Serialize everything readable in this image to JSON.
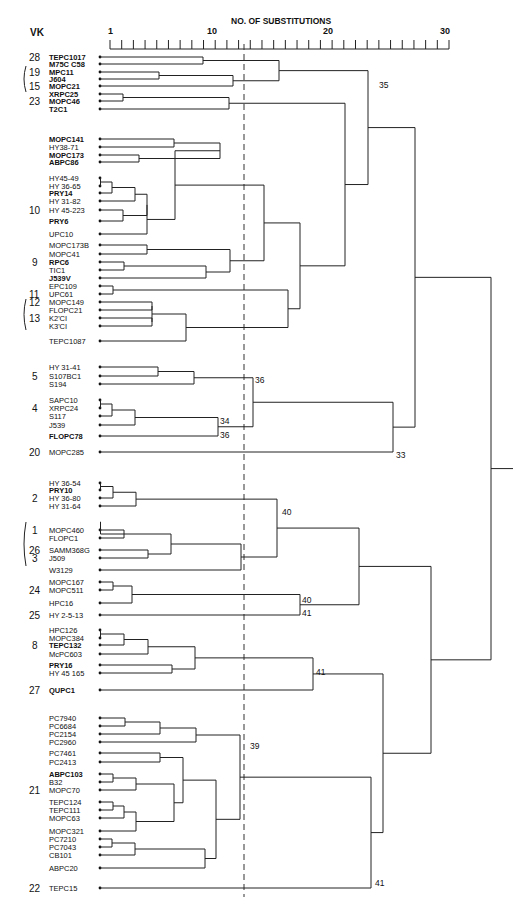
{
  "chart_data": {
    "type": "dendrogram",
    "title": "NO. OF SUBSTITUTIONS",
    "vk_header": "VK",
    "axis": {
      "ticks_labeled": [
        "1",
        "10",
        "20",
        "30"
      ],
      "range": [
        1,
        30
      ],
      "minor_ticks": 30
    },
    "threshold_line_value": 12,
    "leaves": [
      {
        "name": "TEPC1017",
        "bold": true,
        "vk": "28",
        "y": 57
      },
      {
        "name": "M75C C58",
        "bold": true,
        "vk": "",
        "y": 64
      },
      {
        "name": "MPC11",
        "bold": true,
        "vk": "19",
        "y": 72
      },
      {
        "name": "J604",
        "bold": true,
        "vk": "",
        "y": 79
      },
      {
        "name": "MOPC21",
        "bold": true,
        "vk": "15",
        "y": 86
      },
      {
        "name": "XRPC25",
        "bold": true,
        "vk": "",
        "y": 94
      },
      {
        "name": "MOPC46",
        "bold": true,
        "vk": "23",
        "y": 101
      },
      {
        "name": "T2C1",
        "bold": true,
        "vk": "",
        "y": 109
      },
      {
        "name": "MOPC141",
        "bold": true,
        "vk": "",
        "y": 139
      },
      {
        "name": "HY38-71",
        "bold": false,
        "vk": "",
        "y": 147
      },
      {
        "name": "MOPC173",
        "bold": true,
        "vk": "",
        "y": 155
      },
      {
        "name": "ABPC86",
        "bold": true,
        "vk": "",
        "y": 162
      },
      {
        "name": "HY45-49",
        "bold": false,
        "vk": "",
        "y": 178
      },
      {
        "name": "HY 36-65",
        "bold": false,
        "vk": "",
        "y": 186
      },
      {
        "name": "PRY14",
        "bold": true,
        "vk": "",
        "y": 193
      },
      {
        "name": "HY 31-82",
        "bold": false,
        "vk": "",
        "y": 201
      },
      {
        "name": "HY 45-223",
        "bold": false,
        "vk": "10",
        "y": 210
      },
      {
        "name": "PRY6",
        "bold": true,
        "vk": "",
        "y": 221
      },
      {
        "name": "UPC10",
        "bold": false,
        "vk": "",
        "y": 234
      },
      {
        "name": "MOPC173B",
        "bold": false,
        "vk": "",
        "y": 245
      },
      {
        "name": "MOPC41",
        "bold": false,
        "vk": "",
        "y": 254
      },
      {
        "name": "RPC6",
        "bold": true,
        "vk": "9",
        "y": 262
      },
      {
        "name": "TIC1",
        "bold": false,
        "vk": "",
        "y": 270
      },
      {
        "name": "J539V",
        "bold": true,
        "vk": "",
        "y": 278
      },
      {
        "name": "EPC109",
        "bold": false,
        "vk": "",
        "y": 286
      },
      {
        "name": "UPC61",
        "bold": false,
        "vk": "11",
        "y": 294
      },
      {
        "name": "MOPC149",
        "bold": false,
        "vk": "12",
        "y": 302
      },
      {
        "name": "FLOPC21",
        "bold": false,
        "vk": "",
        "y": 310
      },
      {
        "name": "K2'CI",
        "bold": false,
        "vk": "13",
        "y": 318
      },
      {
        "name": "K3'CI",
        "bold": false,
        "vk": "",
        "y": 326
      },
      {
        "name": "TEPC1087",
        "bold": false,
        "vk": "",
        "y": 341
      },
      {
        "name": "HY 31-41",
        "bold": false,
        "vk": "",
        "y": 367
      },
      {
        "name": "S107BC1",
        "bold": false,
        "vk": "5",
        "y": 376
      },
      {
        "name": "S194",
        "bold": false,
        "vk": "",
        "y": 384
      },
      {
        "name": "SAPC10",
        "bold": false,
        "vk": "",
        "y": 400
      },
      {
        "name": "XRPC24",
        "bold": false,
        "vk": "4",
        "y": 408
      },
      {
        "name": "S117",
        "bold": false,
        "vk": "",
        "y": 416
      },
      {
        "name": "J539",
        "bold": false,
        "vk": "",
        "y": 425
      },
      {
        "name": "FLOPC78",
        "bold": true,
        "vk": "",
        "y": 436
      },
      {
        "name": "MOPC285",
        "bold": false,
        "vk": "20",
        "y": 452
      },
      {
        "name": "HY 36-54",
        "bold": false,
        "vk": "",
        "y": 483
      },
      {
        "name": "PRY10",
        "bold": true,
        "vk": "",
        "y": 490
      },
      {
        "name": "HY 36-80",
        "bold": false,
        "vk": "2",
        "y": 498
      },
      {
        "name": "HY 31-64",
        "bold": false,
        "vk": "",
        "y": 506
      },
      {
        "name": "MOPC460",
        "bold": false,
        "vk": "1",
        "y": 530
      },
      {
        "name": "FLOPC1",
        "bold": false,
        "vk": "",
        "y": 538
      },
      {
        "name": "SAMM368G",
        "bold": false,
        "vk": "26",
        "y": 550
      },
      {
        "name": "J509",
        "bold": false,
        "vk": "3",
        "y": 558
      },
      {
        "name": "W3129",
        "bold": false,
        "vk": "",
        "y": 570
      },
      {
        "name": "MOPC167",
        "bold": false,
        "vk": "",
        "y": 582
      },
      {
        "name": "MOPC511",
        "bold": false,
        "vk": "24",
        "y": 590
      },
      {
        "name": "HPC16",
        "bold": false,
        "vk": "",
        "y": 603
      },
      {
        "name": "HY 2-5-13",
        "bold": false,
        "vk": "25",
        "y": 615
      },
      {
        "name": "HPC126",
        "bold": false,
        "vk": "",
        "y": 630
      },
      {
        "name": "MOPC384",
        "bold": false,
        "vk": "",
        "y": 638
      },
      {
        "name": "TEPC132",
        "bold": true,
        "vk": "8",
        "y": 645
      },
      {
        "name": "McPC603",
        "bold": false,
        "vk": "",
        "y": 654
      },
      {
        "name": "PRY16",
        "bold": true,
        "vk": "",
        "y": 665
      },
      {
        "name": "HY 45 165",
        "bold": false,
        "vk": "",
        "y": 673
      },
      {
        "name": "QUPC1",
        "bold": true,
        "vk": "27",
        "y": 690
      },
      {
        "name": "PC7940",
        "bold": false,
        "vk": "",
        "y": 718
      },
      {
        "name": "PC6684",
        "bold": false,
        "vk": "",
        "y": 726
      },
      {
        "name": "PC2154",
        "bold": false,
        "vk": "",
        "y": 734
      },
      {
        "name": "PC2960",
        "bold": false,
        "vk": "",
        "y": 742
      },
      {
        "name": "PC7461",
        "bold": false,
        "vk": "",
        "y": 753
      },
      {
        "name": "PC2413",
        "bold": false,
        "vk": "",
        "y": 762
      },
      {
        "name": "ABPC103",
        "bold": true,
        "vk": "",
        "y": 774
      },
      {
        "name": "B32",
        "bold": false,
        "vk": "",
        "y": 782
      },
      {
        "name": "MOPC70",
        "bold": false,
        "vk": "21",
        "y": 790
      },
      {
        "name": "TEPC124",
        "bold": false,
        "vk": "",
        "y": 802
      },
      {
        "name": "TEPC111",
        "bold": false,
        "vk": "",
        "y": 810
      },
      {
        "name": "MOPC63",
        "bold": false,
        "vk": "",
        "y": 818
      },
      {
        "name": "MOPC321",
        "bold": false,
        "vk": "",
        "y": 831
      },
      {
        "name": "PC7210",
        "bold": false,
        "vk": "",
        "y": 839
      },
      {
        "name": "PC7043",
        "bold": false,
        "vk": "",
        "y": 847
      },
      {
        "name": "CB101",
        "bold": false,
        "vk": "",
        "y": 855
      },
      {
        "name": "ABPC20",
        "bold": false,
        "vk": "",
        "y": 868
      },
      {
        "name": "TEPC15",
        "bold": false,
        "vk": "22",
        "y": 888
      }
    ],
    "node_labels": [
      {
        "text": "35",
        "x": 379,
        "y": 88
      },
      {
        "text": "36",
        "x": 255,
        "y": 383
      },
      {
        "text": "34",
        "x": 220,
        "y": 424
      },
      {
        "text": "36",
        "x": 220,
        "y": 438
      },
      {
        "text": "33",
        "x": 396,
        "y": 458
      },
      {
        "text": "40",
        "x": 282,
        "y": 515
      },
      {
        "text": "40",
        "x": 302,
        "y": 603
      },
      {
        "text": "41",
        "x": 302,
        "y": 616
      },
      {
        "text": "41",
        "x": 316,
        "y": 675
      },
      {
        "text": "39",
        "x": 250,
        "y": 749
      },
      {
        "text": "41",
        "x": 375,
        "y": 886
      }
    ]
  },
  "brackets": [
    {
      "from_vk": "19",
      "to_vk": "15",
      "y1": 66,
      "y2": 92
    },
    {
      "from_vk": "12",
      "to_vk": "13",
      "y1": 299,
      "y2": 330
    },
    {
      "from_vk": "1",
      "to_vk": "3",
      "y1": 522,
      "y2": 566
    }
  ]
}
